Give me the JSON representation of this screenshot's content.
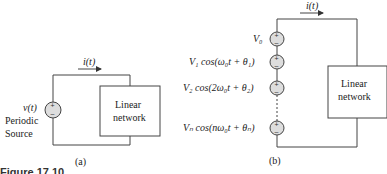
{
  "figure": {
    "caption": "Figure 17.10",
    "panel_a": {
      "label": "(a)",
      "current_label": "i(t)",
      "source_voltage": "v(t)",
      "source_name_line1": "Periodic",
      "source_name_line2": "Source",
      "network_line1": "Linear",
      "network_line2": "network"
    },
    "panel_b": {
      "label": "(b)",
      "current_label": "i(t)",
      "sources": [
        "V₀",
        "V₁ cos(ω₀t + θ₁)",
        "V₂ cos(2ω₀t + θ₂)",
        "Vₙ cos(nω₀t + θₙ)"
      ],
      "network_line1": "Linear",
      "network_line2": "network"
    }
  }
}
